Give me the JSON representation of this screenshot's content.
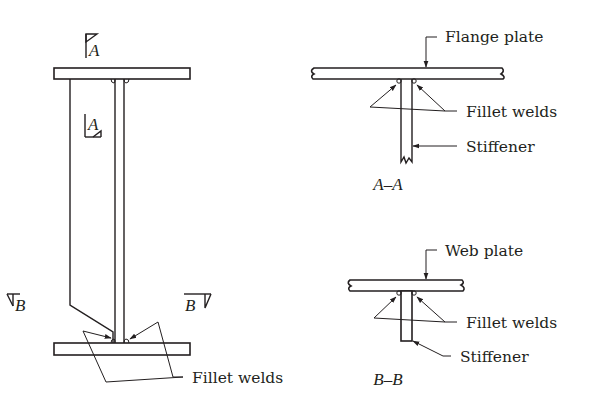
{
  "diagram": {
    "elevation": {
      "section_markers": [
        {
          "id": "A-top",
          "label": "A"
        },
        {
          "id": "A-mid",
          "label": "A"
        },
        {
          "id": "B-left",
          "label": "B"
        },
        {
          "id": "B-right",
          "label": "B"
        }
      ],
      "callouts": {
        "fillet_welds": "Fillet welds"
      }
    },
    "section_aa": {
      "caption": "A–A",
      "labels": {
        "flange_plate": "Flange plate",
        "fillet_welds": "Fillet welds",
        "stiffener": "Stiffener"
      }
    },
    "section_bb": {
      "caption": "B–B",
      "labels": {
        "web_plate": "Web plate",
        "fillet_welds": "Fillet welds",
        "stiffener": "Stiffener"
      }
    },
    "colors": {
      "ink": "#231f20",
      "background": "#ffffff"
    }
  }
}
